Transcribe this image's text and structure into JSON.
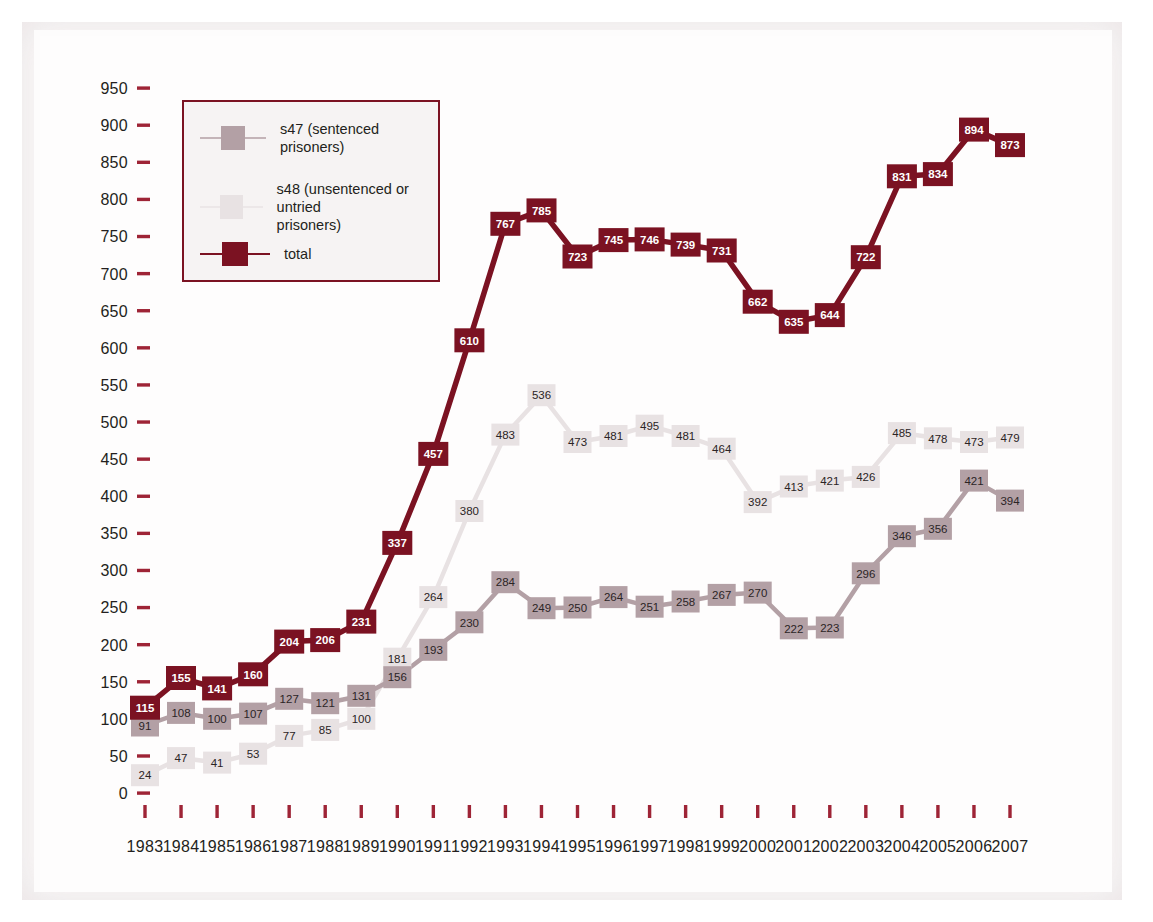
{
  "chart_data": {
    "type": "line",
    "title": "",
    "subtitle": "",
    "xlabel": "",
    "ylabel": "",
    "grid": false,
    "legend_position": "top-left",
    "categories": [
      "1983",
      "1984",
      "1985",
      "1986",
      "1987",
      "1988",
      "1989",
      "1990",
      "1991",
      "1992",
      "1993",
      "1994",
      "1995",
      "1996",
      "1997",
      "1998",
      "1999",
      "2000",
      "2001",
      "2002",
      "2003",
      "2004",
      "2005",
      "2006",
      "2007"
    ],
    "xlim": [
      1983,
      2007
    ],
    "ylim": [
      0,
      950
    ],
    "ytick_step": 50,
    "yticks": [
      "0",
      "50",
      "100",
      "150",
      "200",
      "250",
      "300",
      "350",
      "400",
      "450",
      "500",
      "550",
      "600",
      "650",
      "700",
      "750",
      "800",
      "850",
      "900",
      "950"
    ],
    "series": [
      {
        "name": "s47 (sentenced prisoners)",
        "key": "s47",
        "color": "#b3a0a5",
        "label_style": "dark-on-light",
        "values": [
          91,
          108,
          100,
          107,
          127,
          121,
          131,
          156,
          193,
          230,
          284,
          249,
          250,
          264,
          251,
          258,
          267,
          270,
          222,
          223,
          296,
          346,
          356,
          421,
          394
        ]
      },
      {
        "name": "s48 (unsentenced or untried prisoners)",
        "key": "s48",
        "color": "#e8e2e3",
        "label_style": "dark-on-light",
        "values": [
          24,
          47,
          41,
          53,
          77,
          85,
          100,
          181,
          264,
          380,
          483,
          536,
          473,
          481,
          495,
          481,
          464,
          392,
          413,
          421,
          426,
          485,
          478,
          473,
          479
        ]
      },
      {
        "name": "total",
        "key": "total",
        "color": "#7b1222",
        "label_style": "white-on-dark",
        "values": [
          115,
          155,
          141,
          160,
          204,
          206,
          231,
          337,
          457,
          610,
          767,
          785,
          723,
          745,
          746,
          739,
          731,
          662,
          635,
          644,
          722,
          831,
          834,
          894,
          873
        ]
      }
    ]
  },
  "legend": {
    "border_color": "#7b1222",
    "background": "#f6f3f3",
    "entries": [
      {
        "label": "s47 (sentenced prisoners)",
        "swatch_color": "#b3a0a5",
        "line_color": "#c4b4b8"
      },
      {
        "label": "s48 (unsentenced or untried\nprisoners)",
        "swatch_color": "#e8e2e3",
        "line_color": "#ece7e8"
      },
      {
        "label": "total",
        "swatch_color": "#7b1222",
        "line_color": "#7b1222"
      }
    ]
  },
  "colors": {
    "s47": "#b3a0a5",
    "s48": "#e8e2e3",
    "total": "#7b1222",
    "axis_tick": "#9e2436",
    "text": "#231f20",
    "paper": "#fbf9f9"
  }
}
